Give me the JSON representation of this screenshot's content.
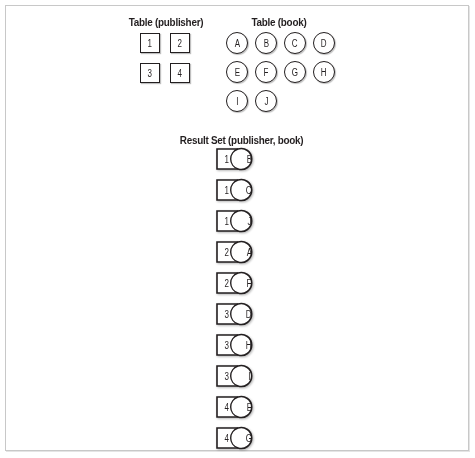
{
  "publisher_table": {
    "title": "Table (publisher)",
    "rows": [
      "1",
      "2",
      "3",
      "4"
    ]
  },
  "book_table": {
    "title": "Table (book)",
    "rows": [
      "A",
      "B",
      "C",
      "D",
      "E",
      "F",
      "G",
      "H",
      "I",
      "J"
    ]
  },
  "result_set": {
    "title": "Result Set (publisher, book)",
    "rows": [
      {
        "publisher": "1",
        "book": "B"
      },
      {
        "publisher": "1",
        "book": "C"
      },
      {
        "publisher": "1",
        "book": "J"
      },
      {
        "publisher": "2",
        "book": "A"
      },
      {
        "publisher": "2",
        "book": "F"
      },
      {
        "publisher": "3",
        "book": "D"
      },
      {
        "publisher": "3",
        "book": "H"
      },
      {
        "publisher": "3",
        "book": "I"
      },
      {
        "publisher": "4",
        "book": "E"
      },
      {
        "publisher": "4",
        "book": "G"
      }
    ]
  },
  "colors": {
    "stroke": "#231f20",
    "frame_border": "#c8c8c8",
    "background": "#ffffff"
  }
}
